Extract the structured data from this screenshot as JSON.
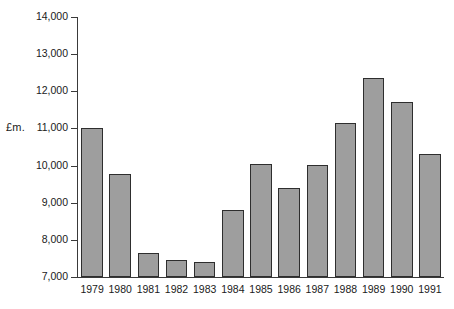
{
  "chart_data": {
    "type": "bar",
    "title": "",
    "xlabel": "",
    "ylabel": "£m.",
    "ylim": [
      7000,
      14000
    ],
    "ytick_step": 1000,
    "grid": false,
    "legend": null,
    "categories": [
      "1979",
      "1980",
      "1981",
      "1982",
      "1983",
      "1984",
      "1985",
      "1986",
      "1987",
      "1988",
      "1989",
      "1990",
      "1991"
    ],
    "values": [
      11000,
      9780,
      7650,
      7450,
      7400,
      8800,
      10030,
      9400,
      10010,
      11150,
      12360,
      11720,
      10300
    ],
    "ytick_labels": [
      "7,000",
      "8,000",
      "9,000",
      "10,000",
      "11,000",
      "12,000",
      "13,000",
      "14,000"
    ],
    "ytick_values": [
      7000,
      8000,
      9000,
      10000,
      11000,
      12000,
      13000,
      14000
    ],
    "bar_fill_color": "#9e9e9e",
    "bar_edge_color": "#2e2e2e",
    "axis_color": "#3a3a3a",
    "background_color": "#ffffff"
  }
}
